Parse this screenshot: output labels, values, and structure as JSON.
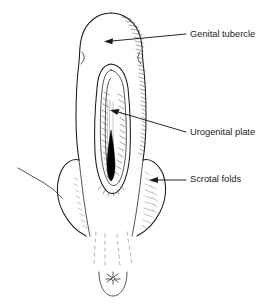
{
  "figure": {
    "title": "Genital tubercle, urogenital plate and scrotal folds",
    "background_color": "#ffffff",
    "ink_color": "#1a1a1a",
    "hatch_color": "#575757",
    "width": 277,
    "height": 306
  },
  "labels": {
    "genital_tubercle": "Genital tubercle",
    "urogenital_plate": "Urogenital plate",
    "scrotal_folds": "Scrotal folds"
  },
  "annotations": [
    {
      "id": "genital-tubercle",
      "text": "Genital tubercle",
      "text_x": 190,
      "text_y": 35,
      "arrow_tip_x": 105,
      "arrow_tip_y": 41,
      "leader_from_x": 186,
      "leader_from_y": 34
    },
    {
      "id": "urogenital-plate",
      "text": "Urogenital plate",
      "text_x": 190,
      "text_y": 133,
      "arrow_tip_x": 112,
      "arrow_tip_y": 113,
      "leader_from_x": 186,
      "leader_from_y": 132
    },
    {
      "id": "scrotal-folds",
      "text": "Scrotal folds",
      "text_x": 190,
      "text_y": 180,
      "arrow_tip_x": 150,
      "arrow_tip_y": 180,
      "leader_from_x": 186,
      "leader_from_y": 180
    }
  ],
  "structures": {
    "genital_tubercle": "dome-shaped glans at top of phallus",
    "phallic_shaft": "tapering shaft below glans",
    "urogenital_plate": "elongated midline groove with hatched interior",
    "urethral_meatus": "dark filled teardrop at base of groove",
    "scrotal_folds": "paired rounded bulges flanking the base",
    "perineal_raphe": "faint dashed midline lines below scrotum",
    "anus": "star-shaped opening within U-shaped curve at bottom",
    "thigh_contour": "thin line running to upper left"
  }
}
